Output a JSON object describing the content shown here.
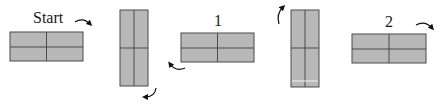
{
  "diagram": {
    "colors": {
      "fill": "#b8b8b8",
      "stroke": "#4a4a4a",
      "arrow": "#111111",
      "highlight": "#f2f2f2"
    },
    "steps": [
      {
        "id": "start",
        "label": "Start",
        "orientation": "horizontal"
      },
      {
        "id": "rotated-1",
        "label": "",
        "orientation": "vertical"
      },
      {
        "id": "step-1",
        "label": "1",
        "orientation": "horizontal"
      },
      {
        "id": "rotated-2",
        "label": "",
        "orientation": "vertical"
      },
      {
        "id": "step-2",
        "label": "2",
        "orientation": "horizontal"
      }
    ],
    "arrows": [
      {
        "id": "arrow-start",
        "direction": "clockwise-down-right"
      },
      {
        "id": "arrow-rot1",
        "direction": "curve-down-left"
      },
      {
        "id": "arrow-step1",
        "direction": "curve-up-left"
      },
      {
        "id": "arrow-rot2",
        "direction": "curve-up-right"
      },
      {
        "id": "arrow-step2",
        "direction": "clockwise-down-right"
      }
    ]
  }
}
